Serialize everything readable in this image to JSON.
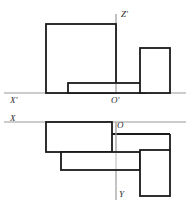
{
  "drawing": {
    "type": "orthographic-projection",
    "description": "Two-view engineering projection sketch with axis labels",
    "stroke_color": "#1a1a1a",
    "axis_color": "#9a9a9a",
    "background_color": "#ffffff",
    "labels": {
      "z_prime": "Z'",
      "x_prime": "X'",
      "o_prime": "O'",
      "x": "X",
      "o": "O",
      "y": "Y"
    },
    "views": {
      "front": {
        "name": "front-view",
        "shapes": [
          {
            "name": "large-square",
            "x": 46,
            "y": 24,
            "width": 70,
            "height": 69
          },
          {
            "name": "low-wide-slab",
            "x": 68,
            "y": 83,
            "width": 77,
            "height": 10
          },
          {
            "name": "tall-right-block",
            "x": 140,
            "y": 48,
            "width": 30,
            "height": 45
          }
        ],
        "ground_line_y": 93,
        "ground_line_x1": 4,
        "ground_line_x2": 186,
        "vertical_axis_x": 116,
        "vertical_axis_y1": 14,
        "vertical_axis_y2": 93
      },
      "top": {
        "name": "top-view",
        "shapes": [
          {
            "name": "upper-wide-rect",
            "x": 46,
            "y": 122,
            "width": 66,
            "height": 30
          },
          {
            "name": "lower-left-rect",
            "x": 61,
            "y": 152,
            "width": 79,
            "height": 18
          },
          {
            "name": "right-tall-rect",
            "x": 140,
            "y": 150,
            "width": 30,
            "height": 46
          }
        ],
        "horizontal_axis_y": 122,
        "horizontal_axis_x1": 4,
        "horizontal_axis_x2": 186,
        "vertical_axis_x": 116,
        "vertical_axis_y1": 122,
        "vertical_axis_y2": 200
      }
    },
    "label_positions": {
      "z_prime": {
        "x": 121,
        "y": 17
      },
      "x_prime": {
        "x": 10,
        "y": 103
      },
      "o_prime": {
        "x": 112,
        "y": 103
      },
      "x": {
        "x": 10,
        "y": 121
      },
      "o": {
        "x": 117,
        "y": 127
      },
      "y": {
        "x": 118,
        "y": 196
      }
    }
  }
}
